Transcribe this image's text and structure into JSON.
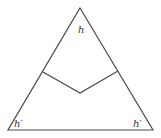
{
  "diagram": {
    "type": "triangle-with-inner-polyline",
    "labels": {
      "apex": "h",
      "bottom_left": "h′",
      "bottom_right": "h′"
    },
    "colors": {
      "stroke": "#4a4a4a",
      "background": "#ffffff",
      "text": "#333333"
    }
  }
}
